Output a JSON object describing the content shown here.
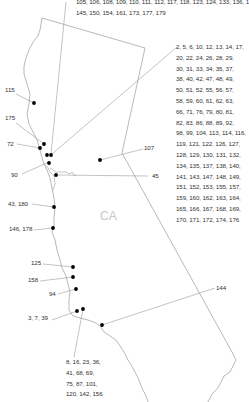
{
  "map": {
    "state_label": "CA",
    "colors": {
      "border": "#9a9a9a",
      "leader": "#9a9a9a",
      "dot": "#000000",
      "text": "#333333",
      "state_label": "#c8c8c8"
    },
    "callouts": [
      {
        "id": "north-top",
        "text": "105, 106, 108, 109, 110, 111, 112, 117, 118, 123, 124, 133, 136, 139,",
        "text2": "145, 150, 154, 161, 173, 177, 179"
      },
      {
        "id": "northeast-big",
        "lines": [
          "2, 5, 6, 10, 12, 13, 14, 17,",
          "20, 22, 24, 26, 28, 29,",
          "30, 31, 33, 34, 35, 37,",
          "38, 40, 42, 47, 48, 49,",
          "50, 51, 52, 55, 56, 57,",
          "58, 59, 60, 61, 62, 63,",
          "66, 71, 76, 79, 80, 81,",
          "82, 83, 86, 88, 89, 92,",
          "98, 99, 104, 113, 114, 116,",
          "119, 121, 122, 126, 127,",
          "128, 129, 130, 131, 132,",
          "134, 135, 137, 138, 140,",
          "141, 143, 147, 148, 149,",
          "151, 152, 153, 155, 157,",
          "159, 160, 162, 163, 164,",
          "165, 166, 167, 168, 169,",
          "170, 171, 172, 174, 176"
        ]
      },
      {
        "id": "c115",
        "text": "115"
      },
      {
        "id": "c175",
        "text": "175"
      },
      {
        "id": "c72",
        "text": "72"
      },
      {
        "id": "c90",
        "text": "90"
      },
      {
        "id": "c107",
        "text": "107"
      },
      {
        "id": "c45",
        "text": "45"
      },
      {
        "id": "c43-180",
        "text": "43, 180"
      },
      {
        "id": "c146-178",
        "text": "146, 178"
      },
      {
        "id": "c125",
        "text": "125"
      },
      {
        "id": "c158",
        "text": "158"
      },
      {
        "id": "c94",
        "text": "94"
      },
      {
        "id": "c3-7-39",
        "text": "3, 7, 39"
      },
      {
        "id": "c144",
        "text": "144"
      },
      {
        "id": "south-bottom",
        "lines": [
          "8, 16, 23, 36,",
          "41, 68, 69,",
          "75, 87, 101,",
          "120, 142, 156"
        ]
      }
    ]
  }
}
